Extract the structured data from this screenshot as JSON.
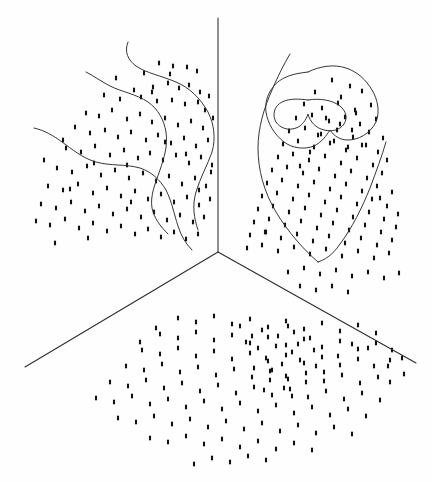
{
  "figure": {
    "title": "",
    "background_color": "#fefefe",
    "ink_color": "#2b2b2b",
    "point_color": "#111111",
    "width": 432,
    "height": 482
  },
  "chart_data": {
    "type": "scatter",
    "title": "",
    "xlabel": "",
    "ylabel": "",
    "grid": false,
    "legend": null,
    "axes": {
      "vertex": [
        218,
        252
      ],
      "vertical_axis": {
        "from": [
          218,
          18
        ],
        "to": [
          218,
          252
        ]
      },
      "left_axis": {
        "from": [
          218,
          252
        ],
        "to": [
          25,
          367
        ]
      },
      "right_axis": {
        "from": [
          218,
          252
        ],
        "to": [
          416,
          363
        ]
      },
      "xlim": [
        0,
        432
      ],
      "ylim": [
        0,
        482
      ]
    },
    "panels": [
      {
        "name": "left-wall",
        "point_count": 118,
        "contour_count": 3
      },
      {
        "name": "right-wall",
        "point_count": 126,
        "contour_count": 4
      },
      {
        "name": "floor",
        "point_count": 150,
        "contour_count": 0
      }
    ],
    "marker": {
      "shape": "vertical-bar",
      "width": 2.1,
      "height": 4.6
    },
    "points_left": [
      [
        159,
        63
      ],
      [
        187,
        67
      ],
      [
        144,
        73
      ],
      [
        170,
        74
      ],
      [
        197,
        71
      ],
      [
        134,
        90
      ],
      [
        153,
        87
      ],
      [
        168,
        83
      ],
      [
        179,
        88
      ],
      [
        189,
        85
      ],
      [
        200,
        92
      ],
      [
        104,
        95
      ],
      [
        120,
        99
      ],
      [
        141,
        97
      ],
      [
        157,
        101
      ],
      [
        172,
        100
      ],
      [
        185,
        104
      ],
      [
        198,
        102
      ],
      [
        209,
        96
      ],
      [
        86,
        113
      ],
      [
        99,
        116
      ],
      [
        112,
        110
      ],
      [
        127,
        119
      ],
      [
        140,
        114
      ],
      [
        152,
        122
      ],
      [
        165,
        118
      ],
      [
        178,
        125
      ],
      [
        191,
        121
      ],
      [
        203,
        128
      ],
      [
        213,
        118
      ],
      [
        75,
        127
      ],
      [
        90,
        133
      ],
      [
        105,
        130
      ],
      [
        118,
        137
      ],
      [
        131,
        132
      ],
      [
        146,
        140
      ],
      [
        158,
        135
      ],
      [
        171,
        143
      ],
      [
        184,
        138
      ],
      [
        196,
        146
      ],
      [
        208,
        140
      ],
      [
        66,
        148
      ],
      [
        81,
        152
      ],
      [
        95,
        146
      ],
      [
        110,
        155
      ],
      [
        124,
        150
      ],
      [
        138,
        158
      ],
      [
        150,
        153
      ],
      [
        163,
        160
      ],
      [
        176,
        155
      ],
      [
        189,
        163
      ],
      [
        201,
        157
      ],
      [
        212,
        165
      ],
      [
        57,
        168
      ],
      [
        72,
        172
      ],
      [
        87,
        166
      ],
      [
        101,
        175
      ],
      [
        115,
        170
      ],
      [
        129,
        178
      ],
      [
        143,
        173
      ],
      [
        156,
        181
      ],
      [
        169,
        176
      ],
      [
        182,
        184
      ],
      [
        195,
        178
      ],
      [
        206,
        186
      ],
      [
        48,
        186
      ],
      [
        63,
        190
      ],
      [
        78,
        184
      ],
      [
        93,
        193
      ],
      [
        107,
        188
      ],
      [
        121,
        196
      ],
      [
        135,
        191
      ],
      [
        148,
        199
      ],
      [
        161,
        194
      ],
      [
        174,
        202
      ],
      [
        187,
        197
      ],
      [
        199,
        205
      ],
      [
        210,
        199
      ],
      [
        41,
        204
      ],
      [
        56,
        208
      ],
      [
        71,
        202
      ],
      [
        85,
        211
      ],
      [
        99,
        206
      ],
      [
        113,
        214
      ],
      [
        127,
        209
      ],
      [
        141,
        217
      ],
      [
        154,
        212
      ],
      [
        167,
        220
      ],
      [
        180,
        215
      ],
      [
        193,
        222
      ],
      [
        204,
        217
      ],
      [
        36,
        221
      ],
      [
        50,
        225
      ],
      [
        65,
        219
      ],
      [
        79,
        228
      ],
      [
        93,
        223
      ],
      [
        107,
        231
      ],
      [
        121,
        226
      ],
      [
        135,
        234
      ],
      [
        148,
        229
      ],
      [
        161,
        237
      ],
      [
        174,
        232
      ],
      [
        186,
        239
      ],
      [
        198,
        234
      ],
      [
        116,
        78
      ],
      [
        173,
        66
      ],
      [
        205,
        110
      ],
      [
        63,
        140
      ],
      [
        94,
        163
      ],
      [
        152,
        92
      ],
      [
        186,
        154
      ],
      [
        211,
        172
      ],
      [
        44,
        160
      ],
      [
        70,
        189
      ],
      [
        127,
        165
      ],
      [
        165,
        142
      ],
      [
        199,
        190
      ],
      [
        131,
        202
      ],
      [
        88,
        238
      ],
      [
        55,
        243
      ]
    ],
    "points_right": [
      [
        332,
        80
      ],
      [
        350,
        86
      ],
      [
        315,
        92
      ],
      [
        341,
        97
      ],
      [
        362,
        91
      ],
      [
        304,
        104
      ],
      [
        322,
        108
      ],
      [
        338,
        103
      ],
      [
        355,
        110
      ],
      [
        371,
        105
      ],
      [
        296,
        118
      ],
      [
        312,
        115
      ],
      [
        329,
        121
      ],
      [
        345,
        117
      ],
      [
        360,
        124
      ],
      [
        376,
        119
      ],
      [
        289,
        131
      ],
      [
        305,
        128
      ],
      [
        321,
        134
      ],
      [
        337,
        130
      ],
      [
        353,
        137
      ],
      [
        369,
        132
      ],
      [
        383,
        138
      ],
      [
        283,
        144
      ],
      [
        298,
        141
      ],
      [
        314,
        147
      ],
      [
        330,
        143
      ],
      [
        346,
        150
      ],
      [
        362,
        145
      ],
      [
        378,
        152
      ],
      [
        278,
        157
      ],
      [
        293,
        154
      ],
      [
        309,
        160
      ],
      [
        325,
        156
      ],
      [
        341,
        163
      ],
      [
        357,
        158
      ],
      [
        373,
        165
      ],
      [
        387,
        160
      ],
      [
        272,
        170
      ],
      [
        287,
        167
      ],
      [
        303,
        173
      ],
      [
        319,
        169
      ],
      [
        335,
        176
      ],
      [
        351,
        171
      ],
      [
        367,
        178
      ],
      [
        382,
        173
      ],
      [
        267,
        183
      ],
      [
        282,
        180
      ],
      [
        298,
        186
      ],
      [
        314,
        182
      ],
      [
        330,
        189
      ],
      [
        346,
        184
      ],
      [
        362,
        191
      ],
      [
        377,
        186
      ],
      [
        392,
        192
      ],
      [
        262,
        196
      ],
      [
        277,
        193
      ],
      [
        293,
        199
      ],
      [
        309,
        195
      ],
      [
        325,
        202
      ],
      [
        341,
        197
      ],
      [
        357,
        204
      ],
      [
        372,
        199
      ],
      [
        387,
        206
      ],
      [
        258,
        209
      ],
      [
        273,
        206
      ],
      [
        289,
        212
      ],
      [
        305,
        208
      ],
      [
        321,
        215
      ],
      [
        337,
        210
      ],
      [
        353,
        217
      ],
      [
        369,
        212
      ],
      [
        384,
        219
      ],
      [
        398,
        214
      ],
      [
        254,
        222
      ],
      [
        269,
        219
      ],
      [
        285,
        225
      ],
      [
        301,
        221
      ],
      [
        317,
        228
      ],
      [
        333,
        223
      ],
      [
        349,
        230
      ],
      [
        365,
        225
      ],
      [
        381,
        232
      ],
      [
        396,
        227
      ],
      [
        250,
        235
      ],
      [
        265,
        232
      ],
      [
        281,
        238
      ],
      [
        297,
        234
      ],
      [
        313,
        241
      ],
      [
        329,
        236
      ],
      [
        345,
        243
      ],
      [
        361,
        238
      ],
      [
        377,
        245
      ],
      [
        392,
        240
      ],
      [
        247,
        248
      ],
      [
        262,
        245
      ],
      [
        278,
        251
      ],
      [
        294,
        247
      ],
      [
        310,
        254
      ],
      [
        326,
        249
      ],
      [
        342,
        256
      ],
      [
        358,
        251
      ],
      [
        374,
        258
      ],
      [
        389,
        253
      ],
      [
        326,
        118
      ],
      [
        340,
        124
      ],
      [
        352,
        130
      ],
      [
        318,
        135
      ],
      [
        334,
        141
      ],
      [
        348,
        147
      ],
      [
        310,
        152
      ],
      [
        356,
        113
      ],
      [
        366,
        145
      ],
      [
        300,
        166
      ],
      [
        380,
        198
      ],
      [
        266,
        232
      ],
      [
        288,
        272
      ],
      [
        304,
        268
      ],
      [
        320,
        274
      ],
      [
        336,
        270
      ],
      [
        352,
        276
      ],
      [
        368,
        272
      ],
      [
        384,
        278
      ],
      [
        399,
        273
      ],
      [
        300,
        286
      ],
      [
        316,
        290
      ],
      [
        332,
        286
      ],
      [
        348,
        292
      ]
    ],
    "points_floor": [
      [
        178,
        318
      ],
      [
        196,
        322
      ],
      [
        214,
        316
      ],
      [
        232,
        324
      ],
      [
        250,
        319
      ],
      [
        268,
        327
      ],
      [
        286,
        321
      ],
      [
        304,
        329
      ],
      [
        322,
        323
      ],
      [
        340,
        331
      ],
      [
        358,
        325
      ],
      [
        376,
        333
      ],
      [
        160,
        334
      ],
      [
        178,
        338
      ],
      [
        196,
        332
      ],
      [
        214,
        340
      ],
      [
        232,
        335
      ],
      [
        250,
        343
      ],
      [
        268,
        337
      ],
      [
        286,
        345
      ],
      [
        304,
        339
      ],
      [
        322,
        347
      ],
      [
        340,
        341
      ],
      [
        358,
        349
      ],
      [
        376,
        343
      ],
      [
        392,
        350
      ],
      [
        142,
        350
      ],
      [
        160,
        354
      ],
      [
        178,
        348
      ],
      [
        196,
        356
      ],
      [
        214,
        351
      ],
      [
        232,
        359
      ],
      [
        250,
        353
      ],
      [
        268,
        361
      ],
      [
        286,
        355
      ],
      [
        304,
        363
      ],
      [
        322,
        357
      ],
      [
        340,
        365
      ],
      [
        358,
        359
      ],
      [
        374,
        366
      ],
      [
        390,
        360
      ],
      [
        126,
        366
      ],
      [
        144,
        370
      ],
      [
        162,
        364
      ],
      [
        180,
        372
      ],
      [
        198,
        367
      ],
      [
        216,
        375
      ],
      [
        234,
        369
      ],
      [
        252,
        377
      ],
      [
        270,
        371
      ],
      [
        288,
        379
      ],
      [
        306,
        373
      ],
      [
        324,
        381
      ],
      [
        342,
        375
      ],
      [
        360,
        383
      ],
      [
        378,
        377
      ],
      [
        110,
        382
      ],
      [
        128,
        386
      ],
      [
        146,
        380
      ],
      [
        164,
        388
      ],
      [
        182,
        383
      ],
      [
        200,
        391
      ],
      [
        218,
        385
      ],
      [
        236,
        393
      ],
      [
        254,
        387
      ],
      [
        272,
        395
      ],
      [
        290,
        389
      ],
      [
        308,
        397
      ],
      [
        326,
        391
      ],
      [
        344,
        399
      ],
      [
        362,
        393
      ],
      [
        380,
        400
      ],
      [
        96,
        398
      ],
      [
        114,
        402
      ],
      [
        132,
        396
      ],
      [
        150,
        404
      ],
      [
        168,
        399
      ],
      [
        186,
        407
      ],
      [
        204,
        401
      ],
      [
        222,
        409
      ],
      [
        240,
        403
      ],
      [
        258,
        411
      ],
      [
        276,
        405
      ],
      [
        294,
        413
      ],
      [
        312,
        407
      ],
      [
        330,
        415
      ],
      [
        348,
        409
      ],
      [
        366,
        416
      ],
      [
        118,
        418
      ],
      [
        136,
        422
      ],
      [
        154,
        416
      ],
      [
        172,
        424
      ],
      [
        190,
        419
      ],
      [
        208,
        427
      ],
      [
        226,
        421
      ],
      [
        244,
        429
      ],
      [
        262,
        423
      ],
      [
        280,
        431
      ],
      [
        298,
        425
      ],
      [
        316,
        433
      ],
      [
        334,
        427
      ],
      [
        352,
        434
      ],
      [
        150,
        438
      ],
      [
        168,
        442
      ],
      [
        186,
        436
      ],
      [
        204,
        444
      ],
      [
        222,
        439
      ],
      [
        240,
        447
      ],
      [
        258,
        441
      ],
      [
        276,
        449
      ],
      [
        294,
        443
      ],
      [
        312,
        450
      ],
      [
        212,
        458
      ],
      [
        230,
        462
      ],
      [
        248,
        456
      ],
      [
        194,
        464
      ],
      [
        266,
        460
      ],
      [
        262,
        330
      ],
      [
        278,
        336
      ],
      [
        294,
        332
      ],
      [
        310,
        338
      ],
      [
        276,
        346
      ],
      [
        292,
        352
      ],
      [
        266,
        358
      ],
      [
        282,
        364
      ],
      [
        298,
        344
      ],
      [
        314,
        350
      ],
      [
        288,
        326
      ],
      [
        272,
        370
      ],
      [
        286,
        376
      ],
      [
        300,
        360
      ],
      [
        316,
        366
      ],
      [
        252,
        336
      ],
      [
        258,
        348
      ],
      [
        270,
        380
      ],
      [
        284,
        388
      ],
      [
        240,
        326
      ],
      [
        246,
        342
      ],
      [
        254,
        368
      ],
      [
        264,
        390
      ],
      [
        292,
        396
      ],
      [
        306,
        382
      ],
      [
        324,
        372
      ],
      [
        338,
        356
      ],
      [
        352,
        344
      ],
      [
        368,
        348
      ],
      [
        388,
        366
      ],
      [
        402,
        358
      ],
      [
        404,
        374
      ],
      [
        390,
        382
      ],
      [
        156,
        328
      ],
      [
        140,
        342
      ]
    ],
    "contours_left": [
      "M 128 42 C 124 52, 128 60, 136 66 C 146 73, 162 76, 176 82 C 190 88, 200 98, 208 112 C 214 124, 216 138, 212 152 C 208 164, 200 178, 196 192 C 192 206, 194 218, 198 230",
      "M 86 72 C 94 76, 102 82, 110 86 C 122 92, 136 94, 148 102 C 158 109, 164 120, 166 132 C 168 146, 164 158, 160 170 C 155 184, 150 196, 152 208 C 154 218, 160 226, 168 234",
      "M 34 128 C 44 130, 54 136, 62 142 C 72 149, 82 158, 96 162 C 110 166, 126 164, 140 168 C 152 172, 160 180, 166 190 C 172 202, 174 214, 178 226 C 181 236, 186 244, 192 250"
    ],
    "contours_right": [
      "M 290 54 C 284 64, 278 76, 272 90 C 264 108, 258 128, 258 148 C 258 170, 264 192, 276 212 C 288 232, 304 250, 318 262",
      "M 386 142 C 382 156, 376 172, 370 188 C 362 208, 352 228, 340 244 C 332 256, 324 260, 318 262",
      "M 308 72 C 320 66, 334 64, 346 68 C 358 72, 366 80, 372 90 C 378 100, 380 112, 376 122 C 370 134, 358 140, 348 140 C 340 140, 334 136, 330 130 C 326 136, 322 142, 314 146 C 304 150, 292 148, 284 142 C 274 134, 268 124, 266 112 C 264 98, 272 84, 284 78 C 292 74, 300 73, 308 72",
      "M 308 100 C 320 98, 332 100, 340 106 C 346 111, 348 118, 344 124 C 340 130, 332 132, 324 130 C 316 128, 310 122, 308 114 C 306 120, 302 126, 296 128 C 288 131, 280 128, 276 122 C 272 115, 274 106, 282 102 C 290 98, 300 99, 308 100"
    ]
  }
}
